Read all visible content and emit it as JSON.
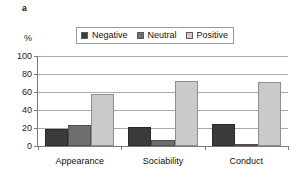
{
  "figure": {
    "panel_letter": "a",
    "y_unit": "%"
  },
  "legend": {
    "items": [
      {
        "label": "Negative",
        "color": "#3b3b3b",
        "swatch": "legend-swatch-negative"
      },
      {
        "label": "Neutral",
        "color": "#6e6e6e",
        "swatch": "legend-swatch-neutral"
      },
      {
        "label": "Positive",
        "color": "#cacaca",
        "swatch": "legend-swatch-positive"
      }
    ]
  },
  "chart_data": {
    "type": "bar",
    "title": "",
    "xlabel": "",
    "ylabel": "%",
    "ylim": [
      0,
      100
    ],
    "yticks": [
      0,
      20,
      40,
      60,
      80,
      100
    ],
    "grid": true,
    "legend_position": "top",
    "categories": [
      "Appearance",
      "Sociability",
      "Conduct"
    ],
    "series": [
      {
        "name": "Negative",
        "color": "#3b3b3b",
        "values": [
          19,
          21,
          25
        ]
      },
      {
        "name": "Neutral",
        "color": "#6e6e6e",
        "values": [
          23,
          7,
          1
        ]
      },
      {
        "name": "Positive",
        "color": "#cacaca",
        "values": [
          58,
          72,
          71
        ]
      }
    ]
  }
}
